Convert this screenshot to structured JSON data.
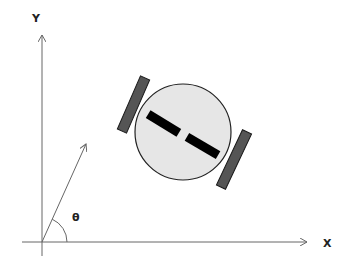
{
  "diagram": {
    "axes": {
      "x_label": "X",
      "y_label": "Y",
      "origin": [
        42,
        242
      ],
      "x_end": [
        307,
        242
      ],
      "y_end": [
        42,
        35
      ]
    },
    "heading": {
      "angle_label": "θ",
      "vector_end": [
        86,
        144
      ],
      "arc_radius": 25
    },
    "robot": {
      "body": {
        "cx": 183,
        "cy": 132,
        "r": 48,
        "fill": "#e6e6e6",
        "stroke": "#222222"
      },
      "wheels": [
        {
          "name": "left-wheel",
          "x1": 145,
          "y1": 78,
          "x2": 122,
          "y2": 131,
          "fill": "#555555"
        },
        {
          "name": "right-wheel",
          "x1": 247,
          "y1": 132,
          "x2": 221,
          "y2": 187,
          "fill": "#555555"
        }
      ],
      "markers": [
        {
          "x1": 148,
          "y1": 114,
          "x2": 179,
          "y2": 133
        },
        {
          "x1": 187,
          "y1": 137,
          "x2": 218,
          "y2": 155
        }
      ]
    },
    "colors": {
      "axis": "#666666",
      "marker": "#000000"
    }
  }
}
